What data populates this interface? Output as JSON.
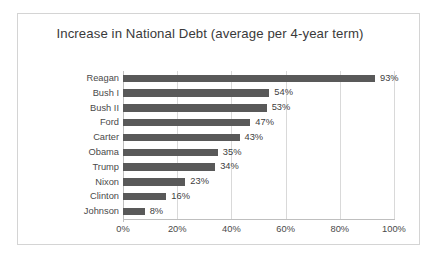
{
  "chart_data": {
    "type": "bar",
    "orientation": "horizontal",
    "title": "Increase in National Debt (average per 4-year term)",
    "xlabel": "",
    "ylabel": "",
    "categories": [
      "Reagan",
      "Bush I",
      "Bush II",
      "Ford",
      "Carter",
      "Obama",
      "Trump",
      "Nixon",
      "Clinton",
      "Johnson"
    ],
    "values": [
      93,
      54,
      53,
      47,
      43,
      35,
      34,
      23,
      16,
      8
    ],
    "data_labels": [
      "93%",
      "54%",
      "53%",
      "47%",
      "43%",
      "35%",
      "34%",
      "23%",
      "16%",
      "8%"
    ],
    "xlim": [
      0,
      100
    ],
    "x_ticks": [
      0,
      20,
      40,
      60,
      80,
      100
    ],
    "x_tick_labels": [
      "0%",
      "20%",
      "40%",
      "60%",
      "80%",
      "100%"
    ],
    "grid": "vertical",
    "legend": "none",
    "bar_color": "#595959",
    "gridline_color": "#d9d9d9",
    "axis_color": "#bfbfbf",
    "text_color": "#4a4a4a",
    "plot_background": "#ffffff",
    "border_color": "#d4d4d4"
  }
}
